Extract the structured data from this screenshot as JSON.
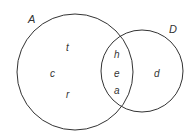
{
  "diagram": {
    "type": "venn",
    "stroke_color": "#333333",
    "sets": [
      {
        "name": "A",
        "cx": 75,
        "cy": 72,
        "r": 58,
        "label_x": 28,
        "label_y": 23
      },
      {
        "name": "D",
        "cx": 142,
        "cy": 71,
        "r": 41,
        "label_x": 169,
        "label_y": 33
      }
    ],
    "regions": {
      "A_only": [
        {
          "label": "t",
          "x": 68,
          "y": 51
        },
        {
          "label": "c",
          "x": 52,
          "y": 77
        },
        {
          "label": "r",
          "x": 68,
          "y": 98
        }
      ],
      "A_and_D": [
        {
          "label": "h",
          "x": 115,
          "y": 58
        },
        {
          "label": "e",
          "x": 115,
          "y": 77
        },
        {
          "label": "a",
          "x": 115,
          "y": 94
        }
      ],
      "D_only": [
        {
          "label": "d",
          "x": 155,
          "y": 77
        }
      ]
    }
  }
}
